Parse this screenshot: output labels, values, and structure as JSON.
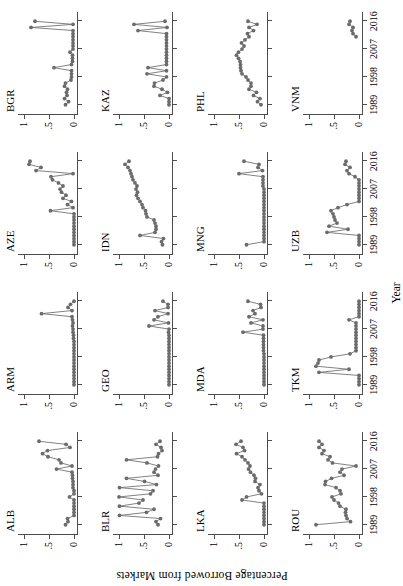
{
  "figure": {
    "ylabel": "Percentage Borrowed from Markets",
    "xlabel": "Year",
    "accent_color": "#6b6b6b",
    "axis_color": "#4d4d4d",
    "rotation_degrees": -90
  },
  "axes": {
    "y_ticks": [
      "0",
      ".5",
      "1"
    ],
    "y_tick_values": [
      0,
      0.5,
      1
    ],
    "ylim": [
      -0.06,
      1.12
    ],
    "x_ticks": [
      "1989",
      "1998",
      "2007",
      "2016"
    ],
    "x_tick_values": [
      1989,
      1998,
      2007,
      2016
    ],
    "xlim": [
      1986,
      2019
    ],
    "grid": false,
    "legend": "none"
  },
  "chart_data": {
    "type": "line",
    "title": "",
    "subtitle": "",
    "xlabel": "Year",
    "ylabel": "Percentage Borrowed from Markets",
    "xlim": [
      1986,
      2019
    ],
    "ylim": [
      -0.06,
      1.12
    ],
    "grid": false,
    "legend_position": "none",
    "panel_layout": {
      "rows": 4,
      "cols": 4
    },
    "panels": [
      {
        "name": "ALB",
        "x": [
          1989,
          1990,
          1991,
          1992,
          1993,
          1994,
          1995,
          1996,
          1997,
          1998,
          1999,
          2000,
          2001,
          2002,
          2003,
          2004,
          2005,
          2006,
          2007,
          2008,
          2009,
          2010,
          2011,
          2012,
          2013,
          2014,
          2015,
          2016
        ],
        "y": [
          0.17,
          0.12,
          0.13,
          0.0,
          0.0,
          0.0,
          0.0,
          0.0,
          0.0,
          0.09,
          0.0,
          0.0,
          0.02,
          0.02,
          0.02,
          0.03,
          0.03,
          0.04,
          0.35,
          0.04,
          0.26,
          0.3,
          0.52,
          0.63,
          0.53,
          0.08,
          0.16,
          0.7
        ]
      },
      {
        "name": "ARM",
        "x": [
          1989,
          1990,
          1991,
          1992,
          1993,
          1994,
          1995,
          1996,
          1997,
          1998,
          1999,
          2000,
          2001,
          2002,
          2003,
          2004,
          2005,
          2006,
          2007,
          2008,
          2009,
          2010,
          2011,
          2012,
          2013,
          2014,
          2015,
          2016
        ],
        "y": [
          0.0,
          0.0,
          0.0,
          0.0,
          0.0,
          0.0,
          0.0,
          0.0,
          0.0,
          0.0,
          0.0,
          0.0,
          0.0,
          0.0,
          0.0,
          0.01,
          0.01,
          0.02,
          0.02,
          0.03,
          0.02,
          0.03,
          0.04,
          0.65,
          0.04,
          0.12,
          0.07,
          0.0
        ]
      },
      {
        "name": "AZE",
        "x": [
          1989,
          1990,
          1991,
          1992,
          1993,
          1994,
          1995,
          1996,
          1997,
          1998,
          1999,
          2000,
          2001,
          2002,
          2003,
          2004,
          2005,
          2006,
          2007,
          2008,
          2009,
          2010,
          2011,
          2012,
          2013,
          2014,
          2015,
          2016
        ],
        "y": [
          0.0,
          0.0,
          0.0,
          0.0,
          0.0,
          0.0,
          0.0,
          0.0,
          0.0,
          0.0,
          0.0,
          0.47,
          0.02,
          0.13,
          0.05,
          0.22,
          0.16,
          0.25,
          0.28,
          0.22,
          0.31,
          0.43,
          0.46,
          0.02,
          0.76,
          0.66,
          0.9,
          0.88
        ]
      },
      {
        "name": "BGR",
        "x": [
          1989,
          1990,
          1991,
          1992,
          1993,
          1994,
          1995,
          1996,
          1997,
          1998,
          1999,
          2000,
          2001,
          2002,
          2003,
          2004,
          2005,
          2006,
          2007,
          2008,
          2009,
          2010,
          2011,
          2012,
          2013,
          2014,
          2015,
          2016
        ],
        "y": [
          0.17,
          0.11,
          0.19,
          0.14,
          0.15,
          0.13,
          0.19,
          0.17,
          0.06,
          0.05,
          0.05,
          0.05,
          0.4,
          0.05,
          0.03,
          0.03,
          0.03,
          0.08,
          0.02,
          0.02,
          0.02,
          0.02,
          0.02,
          0.02,
          0.02,
          0.86,
          0.02,
          0.78
        ]
      },
      {
        "name": "BLR",
        "x": [
          1989,
          1990,
          1991,
          1992,
          1993,
          1994,
          1995,
          1996,
          1997,
          1998,
          1999,
          2000,
          2001,
          2002,
          2003,
          2004,
          2005,
          2006,
          2007,
          2008,
          2009,
          2010,
          2011,
          2012,
          2013,
          2014,
          2015,
          2016
        ],
        "y": [
          0.22,
          0.26,
          0.17,
          0.99,
          0.45,
          0.3,
          0.99,
          0.6,
          0.52,
          1.0,
          0.37,
          0.32,
          0.99,
          0.25,
          0.49,
          0.85,
          0.22,
          0.3,
          0.27,
          0.21,
          0.44,
          0.85,
          0.23,
          0.21,
          0.14,
          0.16,
          0.26,
          0.18
        ]
      },
      {
        "name": "GEO",
        "x": [
          1989,
          1990,
          1991,
          1992,
          1993,
          1994,
          1995,
          1996,
          1997,
          1998,
          1999,
          2000,
          2001,
          2002,
          2003,
          2004,
          2005,
          2006,
          2007,
          2008,
          2009,
          2010,
          2011,
          2012,
          2013,
          2014,
          2015,
          2016
        ],
        "y": [
          0.0,
          0.0,
          0.0,
          0.0,
          0.0,
          0.0,
          0.0,
          0.0,
          0.0,
          0.0,
          0.0,
          0.0,
          0.0,
          0.0,
          0.0,
          0.0,
          0.0,
          0.01,
          0.0,
          0.4,
          0.01,
          0.3,
          0.22,
          0.02,
          0.28,
          0.02,
          0.02,
          0.12
        ]
      },
      {
        "name": "IDN",
        "x": [
          1989,
          1990,
          1991,
          1992,
          1993,
          1994,
          1995,
          1996,
          1997,
          1998,
          1999,
          2000,
          2001,
          2002,
          2003,
          2004,
          2005,
          2006,
          2007,
          2008,
          2009,
          2010,
          2011,
          2012,
          2013,
          2014,
          2015,
          2016
        ],
        "y": [
          0.13,
          0.15,
          0.11,
          0.58,
          0.28,
          0.26,
          0.26,
          0.28,
          0.3,
          0.44,
          0.46,
          0.47,
          0.52,
          0.54,
          0.58,
          0.62,
          0.65,
          0.63,
          0.66,
          0.64,
          0.68,
          0.72,
          0.74,
          0.76,
          0.78,
          0.82,
          0.88,
          0.8
        ]
      },
      {
        "name": "KAZ",
        "x": [
          1989,
          1990,
          1991,
          1992,
          1993,
          1994,
          1995,
          1996,
          1997,
          1998,
          1999,
          2000,
          2001,
          2002,
          2003,
          2004,
          2005,
          2006,
          2007,
          2008,
          2009,
          2010,
          2011,
          2012,
          2013,
          2014,
          2015,
          2016
        ],
        "y": [
          0.0,
          0.0,
          0.0,
          0.18,
          0.03,
          0.14,
          0.3,
          0.29,
          0.12,
          0.05,
          0.44,
          0.05,
          0.42,
          0.05,
          0.05,
          0.05,
          0.05,
          0.05,
          0.05,
          0.05,
          0.05,
          0.05,
          0.05,
          0.05,
          0.62,
          0.04,
          0.7,
          0.08
        ]
      },
      {
        "name": "LKA",
        "x": [
          1989,
          1990,
          1991,
          1992,
          1993,
          1994,
          1995,
          1996,
          1997,
          1998,
          1999,
          2000,
          2001,
          2002,
          2003,
          2004,
          2005,
          2006,
          2007,
          2008,
          2009,
          2010,
          2011,
          2012,
          2013,
          2014,
          2015,
          2016
        ],
        "y": [
          0.0,
          0.0,
          0.0,
          0.0,
          0.0,
          0.0,
          0.0,
          0.0,
          0.44,
          0.35,
          0.05,
          0.1,
          0.12,
          0.08,
          0.18,
          0.17,
          0.2,
          0.27,
          0.31,
          0.28,
          0.32,
          0.38,
          0.44,
          0.55,
          0.39,
          0.42,
          0.56,
          0.46
        ]
      },
      {
        "name": "MDA",
        "x": [
          1989,
          1990,
          1991,
          1992,
          1993,
          1994,
          1995,
          1996,
          1997,
          1998,
          1999,
          2000,
          2001,
          2002,
          2003,
          2004,
          2005,
          2006,
          2007,
          2008,
          2009,
          2010,
          2011,
          2012,
          2013,
          2014,
          2015,
          2016
        ],
        "y": [
          0.0,
          0.0,
          0.0,
          0.0,
          0.0,
          0.0,
          0.0,
          0.0,
          0.0,
          0.0,
          0.0,
          0.01,
          0.01,
          0.01,
          0.01,
          0.01,
          0.01,
          0.42,
          0.02,
          0.02,
          0.26,
          0.02,
          0.3,
          0.18,
          0.22,
          0.06,
          0.07,
          0.32
        ]
      },
      {
        "name": "MNG",
        "x": [
          1989,
          1990,
          1991,
          1992,
          1993,
          1994,
          1995,
          1996,
          1997,
          1998,
          1999,
          2000,
          2001,
          2002,
          2003,
          2004,
          2005,
          2006,
          2007,
          2008,
          2009,
          2010,
          2011,
          2012,
          2013,
          2014,
          2015,
          2016
        ],
        "y": [
          0.35,
          0.0,
          0.0,
          0.0,
          0.0,
          0.0,
          0.0,
          0.0,
          0.0,
          0.0,
          0.0,
          0.0,
          0.0,
          0.0,
          0.0,
          0.0,
          0.0,
          0.0,
          0.0,
          0.02,
          0.02,
          0.02,
          0.02,
          0.5,
          0.03,
          0.12,
          0.1,
          0.4
        ]
      },
      {
        "name": "PHL",
        "x": [
          1989,
          1990,
          1991,
          1992,
          1993,
          1994,
          1995,
          1996,
          1997,
          1998,
          1999,
          2000,
          2001,
          2002,
          2003,
          2004,
          2005,
          2006,
          2007,
          2008,
          2009,
          2010,
          2011,
          2012,
          2013,
          2014,
          2015,
          2016
        ],
        "y": [
          0.06,
          0.13,
          0.08,
          0.21,
          0.15,
          0.3,
          0.26,
          0.26,
          0.32,
          0.36,
          0.44,
          0.46,
          0.47,
          0.47,
          0.48,
          0.51,
          0.55,
          0.51,
          0.44,
          0.4,
          0.45,
          0.38,
          0.3,
          0.33,
          0.21,
          0.3,
          0.14,
          0.32
        ]
      },
      {
        "name": "ROU",
        "x": [
          1989,
          1990,
          1991,
          1992,
          1993,
          1994,
          1995,
          1996,
          1997,
          1998,
          1999,
          2000,
          2001,
          2002,
          2003,
          2004,
          2005,
          2006,
          2007,
          2008,
          2009,
          2010,
          2011,
          2012,
          2013,
          2014,
          2015,
          2016
        ],
        "y": [
          0.86,
          0.17,
          0.24,
          0.26,
          0.27,
          0.26,
          0.38,
          0.41,
          0.5,
          0.54,
          0.36,
          0.38,
          0.46,
          0.68,
          0.67,
          0.55,
          0.3,
          0.38,
          0.34,
          0.06,
          0.53,
          0.62,
          0.58,
          0.74,
          0.7,
          0.8,
          0.74,
          0.8
        ]
      },
      {
        "name": "TKM",
        "x": [
          1989,
          1990,
          1991,
          1992,
          1993,
          1994,
          1995,
          1996,
          1997,
          1998,
          1999,
          2000,
          2001,
          2002,
          2003,
          2004,
          2005,
          2006,
          2007,
          2008,
          2009,
          2010,
          2011,
          2012,
          2013,
          2014,
          2015,
          2016
        ],
        "y": [
          0.0,
          0.0,
          0.0,
          0.0,
          0.8,
          0.2,
          0.86,
          0.82,
          0.8,
          0.56,
          0.18,
          0.06,
          0.06,
          0.06,
          0.06,
          0.06,
          0.06,
          0.06,
          0.06,
          0.06,
          0.06,
          0.2,
          0.0,
          0.0,
          0.0,
          0.0,
          0.0,
          0.0
        ]
      },
      {
        "name": "UZB",
        "x": [
          1989,
          1990,
          1991,
          1992,
          1993,
          1994,
          1995,
          1996,
          1997,
          1998,
          1999,
          2000,
          2001,
          2002,
          2003,
          2004,
          2005,
          2006,
          2007,
          2008,
          2009,
          2010,
          2011,
          2012,
          2013,
          2014,
          2015,
          2016
        ],
        "y": [
          0.0,
          0.0,
          0.0,
          0.0,
          0.64,
          0.22,
          0.6,
          0.44,
          0.48,
          0.5,
          0.52,
          0.56,
          0.42,
          0.24,
          0.0,
          0.0,
          0.0,
          0.0,
          0.0,
          0.0,
          0.0,
          0.0,
          0.08,
          0.2,
          0.24,
          0.18,
          0.28,
          0.26
        ]
      },
      {
        "name": "VNM",
        "x": [
          2011,
          2012,
          2013,
          2014,
          2015,
          2016
        ],
        "y": [
          0.06,
          0.12,
          0.14,
          0.12,
          0.2,
          0.18
        ]
      }
    ]
  }
}
